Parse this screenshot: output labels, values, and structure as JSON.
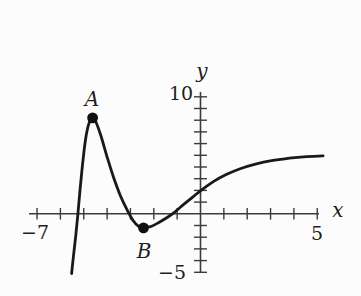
{
  "figure": {
    "background": "#fcfcfc",
    "curve_color": "#191919",
    "axis_color": "#3c3c3c",
    "point_color": "#101010"
  },
  "labels": {
    "point_a": "A",
    "point_b": "B",
    "x_axis": "x",
    "y_axis": "y",
    "x_min": "−7",
    "x_max": "5",
    "y_max": "10",
    "y_min": "−5"
  },
  "chart_data": {
    "type": "line",
    "title": "",
    "xlabel": "x",
    "ylabel": "y",
    "xlim": [
      -7,
      5
    ],
    "ylim": [
      -5,
      10
    ],
    "x_tick_step": 1,
    "y_tick_step": 1,
    "grid": false,
    "legend": false,
    "axis_end_labels": {
      "x": [
        "−7",
        "5"
      ],
      "y": [
        "10",
        "−5"
      ]
    },
    "series": [
      {
        "name": "f",
        "points": [
          [
            -5.52,
            -5.1
          ],
          [
            -5.44,
            -3.6
          ],
          [
            -5.35,
            -2.0
          ],
          [
            -5.26,
            -0.2
          ],
          [
            -5.15,
            2.2
          ],
          [
            -5.02,
            4.8
          ],
          [
            -4.88,
            6.9
          ],
          [
            -4.75,
            7.9
          ],
          [
            -4.62,
            8.2
          ],
          [
            -4.48,
            7.85
          ],
          [
            -4.28,
            6.75
          ],
          [
            -4.02,
            5.0
          ],
          [
            -3.72,
            3.1
          ],
          [
            -3.42,
            1.5
          ],
          [
            -3.12,
            0.25
          ],
          [
            -2.88,
            -0.6
          ],
          [
            -2.64,
            -1.1
          ],
          [
            -2.44,
            -1.2
          ],
          [
            -2.15,
            -1.1
          ],
          [
            -1.85,
            -0.82
          ],
          [
            -1.5,
            -0.4
          ],
          [
            -1.13,
            0.1
          ],
          [
            -0.72,
            0.8
          ],
          [
            -0.32,
            1.45
          ],
          [
            0.05,
            2.05
          ],
          [
            0.55,
            2.75
          ],
          [
            1.1,
            3.35
          ],
          [
            1.7,
            3.85
          ],
          [
            2.35,
            4.25
          ],
          [
            3.05,
            4.55
          ],
          [
            3.8,
            4.75
          ],
          [
            4.55,
            4.88
          ],
          [
            5.25,
            4.95
          ]
        ]
      }
    ],
    "marked_points": [
      {
        "label": "A",
        "x": -4.62,
        "y": 8.2
      },
      {
        "label": "B",
        "x": -2.44,
        "y": -1.2
      }
    ]
  }
}
